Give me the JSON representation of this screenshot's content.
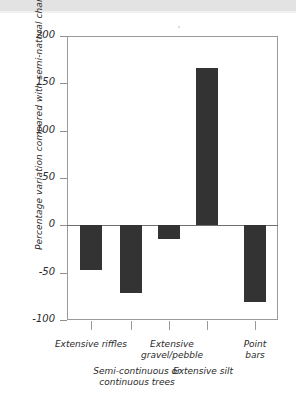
{
  "chart_data": {
    "type": "bar",
    "title": "",
    "subtitle": "",
    "xlabel": "",
    "ylabel": "Percentage variation compared with semi-natural channels",
    "categories": [
      "Extensive riffles",
      "Semi-continuous or\ncontinuous trees",
      "Extensive\ngravel/pebble",
      "Extensive silt",
      "Point bars"
    ],
    "values": [
      -47,
      -72,
      -14,
      166,
      -81
    ],
    "ylim": [
      -100,
      200
    ],
    "yticks": [
      200,
      150,
      100,
      50,
      0,
      -50,
      -100
    ],
    "ytick_labels": [
      "200",
      "150",
      "100",
      "50",
      "0",
      "-50",
      "-100"
    ],
    "grid": false,
    "legend": null,
    "bar_color": "#333333",
    "axis_color": "#9a9a9a",
    "zero_line": 0,
    "label_rows": [
      0,
      1,
      0,
      1,
      0
    ]
  },
  "axis": {
    "y_title": "Percentage variation compared with semi-natural channels",
    "ticks": [
      {
        "label": "200",
        "value": 200
      },
      {
        "label": "150",
        "value": 150
      },
      {
        "label": "100",
        "value": 100
      },
      {
        "label": "50",
        "value": 50
      },
      {
        "label": "0",
        "value": 0
      },
      {
        "label": "-50",
        "value": -50
      },
      {
        "label": "-100",
        "value": -100
      }
    ]
  },
  "bars": [
    {
      "label": "Extensive riffles",
      "value": -47
    },
    {
      "label": "Semi-continuous or\ncontinuous trees",
      "value": -72
    },
    {
      "label": "Extensive\ngravel/pebble",
      "value": -14
    },
    {
      "label": "Extensive silt",
      "value": 166
    },
    {
      "label": "Point bars",
      "value": -81
    }
  ]
}
